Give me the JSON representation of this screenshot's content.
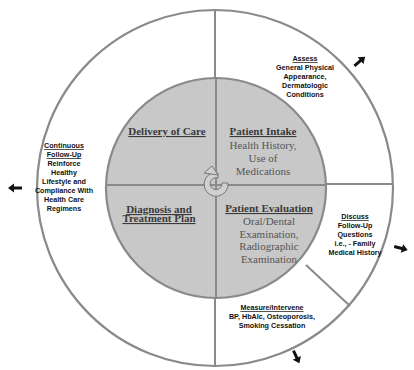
{
  "colors": {
    "inner_fill": "#c8c8c8",
    "outer_fill": "#ffffff",
    "line": "#8a8a8a",
    "arrow": "#111111"
  },
  "inner": {
    "delivery_of_care": {
      "title": "Delivery of Care"
    },
    "patient_intake": {
      "title": "Patient Intake",
      "lines": [
        "Health History,",
        "Use of",
        "Medications"
      ]
    },
    "diagnosis": {
      "title_lines": [
        "Diagnosis and",
        "Treatment Plan"
      ]
    },
    "patient_evaluation": {
      "title": "Patient Evaluation",
      "lines": [
        "Oral/Dental",
        "Examination,",
        "Radiographic",
        "Examination"
      ]
    },
    "center_icon": "circular-arrow-icon"
  },
  "outer": {
    "assess": {
      "title": "Assess",
      "lines": [
        "General Physical",
        "Appearance,",
        "Dermatologic",
        "Conditions"
      ]
    },
    "continuous": {
      "title_lines": [
        "Continuous",
        "Follow-Up"
      ],
      "lines": [
        "Reinforce",
        "Healthy",
        "Lifestyle and",
        "Compliance With",
        "Health Care",
        "Regimens"
      ]
    },
    "discuss": {
      "title": "Discuss",
      "lines": [
        "Follow-Up",
        "Questions",
        "i.e., - Family",
        "Medical History"
      ]
    },
    "measure": {
      "title": "Measure/Intervene",
      "lines": [
        "BP, HbAlc, Osteoporosis,",
        "Smoking Cessation"
      ]
    }
  }
}
